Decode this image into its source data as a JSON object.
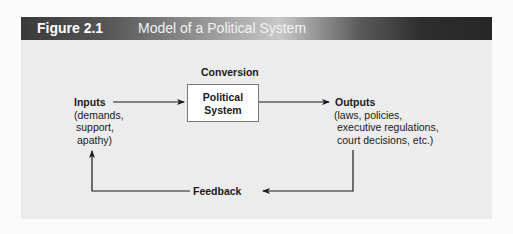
{
  "figure": {
    "number": "Figure 2.1",
    "title": "Model of a Political System"
  },
  "diagram": {
    "conversion_label": "Conversion",
    "system_box": {
      "line1": "Political",
      "line2": "System"
    },
    "inputs": {
      "label": "Inputs",
      "details": [
        "(demands,",
        "support,",
        "apathy)"
      ]
    },
    "outputs": {
      "label": "Outputs",
      "details": [
        "(laws, policies,",
        "executive regulations,",
        "court decisions, etc.)"
      ]
    },
    "feedback_label": "Feedback"
  }
}
